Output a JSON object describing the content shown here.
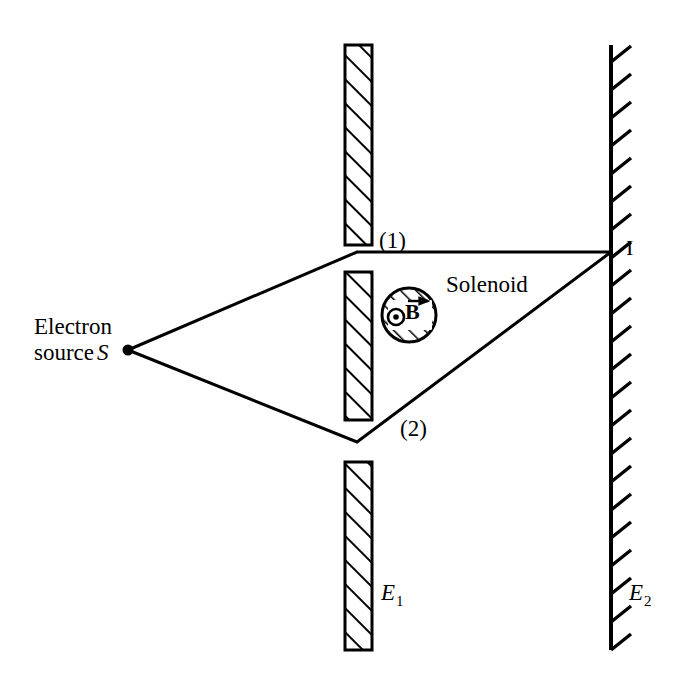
{
  "figure": {
    "background_color": "#ffffff",
    "ink_color": "#000000"
  },
  "labels": {
    "electron_source": "Electron",
    "electron_source_line2": "source",
    "electron_source_symbol": "S",
    "path_upper": "(1)",
    "path_lower": "(2)",
    "solenoid": "Solenoid",
    "interference_point": "I",
    "screen_first": "E",
    "screen_first_sub": "1",
    "screen_second": "E",
    "screen_second_sub": "2",
    "magnetic_field": "B"
  },
  "geometry": {
    "source_point": {
      "x": 128,
      "y": 350
    },
    "slit_upper_vertex": {
      "x": 357,
      "y": 252
    },
    "slit_lower_vertex": {
      "x": 357,
      "y": 442
    },
    "detection_point": {
      "x": 611,
      "y": 252
    },
    "solenoid_center": {
      "x": 409,
      "y": 315
    },
    "solenoid_radius": 27,
    "barrier_x_left": 345,
    "barrier_x_right": 372,
    "barrier_top_segment": {
      "y1": 45,
      "y2": 245
    },
    "barrier_middle_segment": {
      "y1": 272,
      "y2": 420
    },
    "barrier_bottom_segment": {
      "y1": 462,
      "y2": 650
    },
    "screen_second_x": 611,
    "screen_second_y1": 45,
    "screen_second_y2": 650
  }
}
